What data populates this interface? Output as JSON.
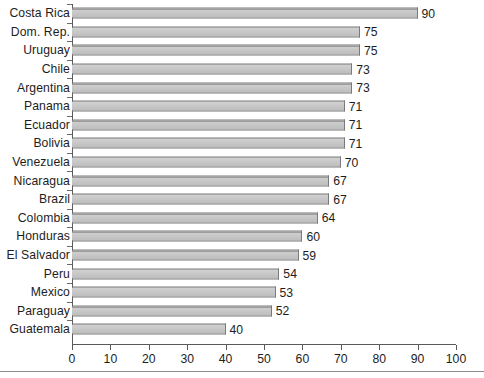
{
  "chart_data": {
    "type": "bar",
    "orientation": "horizontal",
    "title": "",
    "subtitle": "",
    "xlabel": "",
    "ylabel": "",
    "xlim": [
      0,
      100
    ],
    "xticks": [
      0,
      10,
      20,
      30,
      40,
      50,
      60,
      70,
      80,
      90,
      100
    ],
    "grid": false,
    "legend": null,
    "data_labels": true,
    "categories": [
      "Costa Rica",
      "Dom. Rep.",
      "Uruguay",
      "Chile",
      "Argentina",
      "Panama",
      "Ecuador",
      "Bolivia",
      "Venezuela",
      "Nicaragua",
      "Brazil",
      "Colombia",
      "Honduras",
      "El Salvador",
      "Peru",
      "Mexico",
      "Paraguay",
      "Guatemala"
    ],
    "values": [
      90,
      75,
      75,
      73,
      73,
      71,
      71,
      71,
      70,
      67,
      67,
      64,
      60,
      59,
      54,
      53,
      52,
      40
    ],
    "colors": {
      "bar_fill": "#c6c6c6",
      "bar_edge": "#7a7a7a",
      "axis": "#5a5a5a",
      "text": "#1d1d1d",
      "background": "#ffffff"
    }
  }
}
